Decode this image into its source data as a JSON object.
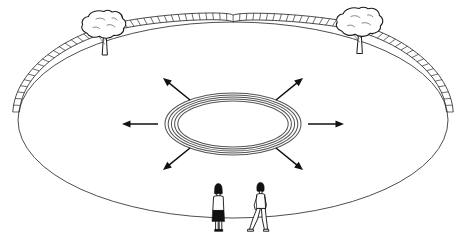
{
  "figure": {
    "background_color": "#ffffff",
    "ink_color": "#1a1a1a",
    "width": 467,
    "height": 244
  },
  "ground": {
    "name": "elliptical-platform",
    "center_x": 233,
    "center_y": 120,
    "radius_x": 215,
    "radius_y": 98,
    "edge_color": "#3a3a3a",
    "fill_color": "#ffffff",
    "near_edge_style": "plain-line",
    "far_edge_style": "railing"
  },
  "railing": {
    "name": "perimeter-railing",
    "post_count": 76,
    "span_start_degrees": 172,
    "span_end_degrees": 368,
    "rail_color": "#2b2b2b",
    "height": 7
  },
  "rings": {
    "name": "concentric-rings",
    "count": 5,
    "center_x": 233,
    "center_y": 124,
    "outer_radius_x": 68,
    "outer_radius_y": 31,
    "spacing": 3.2,
    "color": "#555555"
  },
  "arrows": {
    "name": "radial-arrows",
    "count": 6,
    "color": "#111111",
    "items": [
      {
        "label": "arrow-west",
        "direction": "left",
        "angle_degrees": 180,
        "x1": 158,
        "y1": 124,
        "x2": 122,
        "y2": 124
      },
      {
        "label": "arrow-east",
        "direction": "right",
        "angle_degrees": 0,
        "x1": 308,
        "y1": 124,
        "x2": 344,
        "y2": 124
      },
      {
        "label": "arrow-northwest",
        "direction": "up-left",
        "angle_degrees": 135,
        "x1": 190,
        "y1": 100,
        "x2": 163,
        "y2": 78
      },
      {
        "label": "arrow-northeast",
        "direction": "up-right",
        "angle_degrees": 45,
        "x1": 276,
        "y1": 100,
        "x2": 303,
        "y2": 78
      },
      {
        "label": "arrow-southwest",
        "direction": "down-left",
        "angle_degrees": 225,
        "x1": 190,
        "y1": 148,
        "x2": 163,
        "y2": 170
      },
      {
        "label": "arrow-southeast",
        "direction": "down-right",
        "angle_degrees": 315,
        "x1": 276,
        "y1": 148,
        "x2": 303,
        "y2": 170
      }
    ]
  },
  "trees": {
    "name": "trees",
    "count": 2,
    "items": [
      {
        "label": "tree-left",
        "x": 105,
        "y": 30,
        "canopy_width": 36,
        "canopy_height": 26,
        "trunk_height": 24
      },
      {
        "label": "tree-right",
        "x": 360,
        "y": 27,
        "canopy_width": 38,
        "canopy_height": 26,
        "trunk_height": 24
      }
    ]
  },
  "people": {
    "name": "people",
    "count": 2,
    "items": [
      {
        "label": "person-standing",
        "pose": "standing-back-view",
        "x": 218,
        "y": 188,
        "height": 42,
        "hair": "dark",
        "skirt": "dark"
      },
      {
        "label": "person-walking",
        "pose": "walking-profile",
        "x": 260,
        "y": 186,
        "height": 45,
        "hair": "dark",
        "clothing": "light"
      }
    ]
  }
}
